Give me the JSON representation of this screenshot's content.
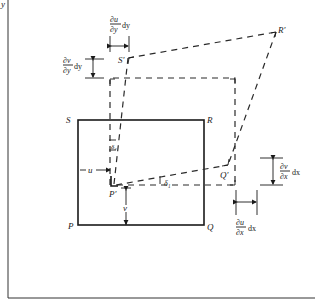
{
  "figure": {
    "axis_label_y": "y",
    "corners": {
      "P": "P",
      "Q": "Q",
      "R": "R",
      "S": "S",
      "P_prime": "P′",
      "Q_prime": "Q′",
      "R_prime": "R′",
      "S_prime": "S′"
    },
    "displacements": {
      "u": "u",
      "v": "v"
    },
    "angles": {
      "delta1": "δ₁",
      "delta2": "δ₂"
    },
    "annotations": {
      "du_dy_num": "∂u",
      "du_dy_den": "∂y",
      "du_dy_suffix": "dy",
      "dv_dy_num": "∂v",
      "dv_dy_den": "∂y",
      "dv_dy_suffix": "dy",
      "dv_dx_num": "∂v",
      "dv_dx_den": "∂x",
      "dv_dx_suffix": "dx",
      "du_dx_num": "∂u",
      "du_dx_den": "∂x",
      "du_dx_suffix": "dx"
    }
  }
}
